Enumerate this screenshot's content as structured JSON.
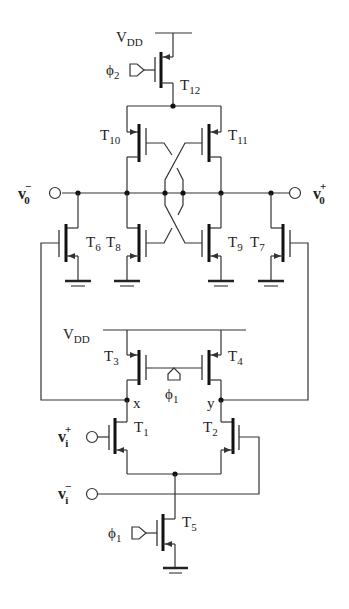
{
  "diagram": {
    "type": "circuit-schematic",
    "supply_label": {
      "main": "V",
      "sub": "DD"
    },
    "clocks": {
      "phi1": {
        "main": "ϕ",
        "sub": "1"
      },
      "phi2": {
        "main": "ϕ",
        "sub": "2"
      }
    },
    "transistors": [
      {
        "id": "T1",
        "main": "T",
        "sub": "1",
        "type": "nmos"
      },
      {
        "id": "T2",
        "main": "T",
        "sub": "2",
        "type": "nmos"
      },
      {
        "id": "T3",
        "main": "T",
        "sub": "3",
        "type": "pmos"
      },
      {
        "id": "T4",
        "main": "T",
        "sub": "4",
        "type": "pmos"
      },
      {
        "id": "T5",
        "main": "T",
        "sub": "5",
        "type": "nmos"
      },
      {
        "id": "T6",
        "main": "T",
        "sub": "6",
        "type": "nmos"
      },
      {
        "id": "T7",
        "main": "T",
        "sub": "7",
        "type": "nmos"
      },
      {
        "id": "T8",
        "main": "T",
        "sub": "8",
        "type": "nmos"
      },
      {
        "id": "T9",
        "main": "T",
        "sub": "9",
        "type": "nmos"
      },
      {
        "id": "T10",
        "main": "T",
        "sub": "10",
        "type": "pmos"
      },
      {
        "id": "T11",
        "main": "T",
        "sub": "11",
        "type": "pmos"
      },
      {
        "id": "T12",
        "main": "T",
        "sub": "12",
        "type": "pmos"
      }
    ],
    "nodes": {
      "x": "x",
      "y": "y"
    },
    "terminals": {
      "vo_minus": {
        "main": "v",
        "sub": "0",
        "sup": "−"
      },
      "vo_plus": {
        "main": "v",
        "sub": "0",
        "sup": "+"
      },
      "vi_plus": {
        "main": "v",
        "sub": "i",
        "sup": "+"
      },
      "vi_minus": {
        "main": "v",
        "sub": "i",
        "sup": "−"
      }
    }
  }
}
